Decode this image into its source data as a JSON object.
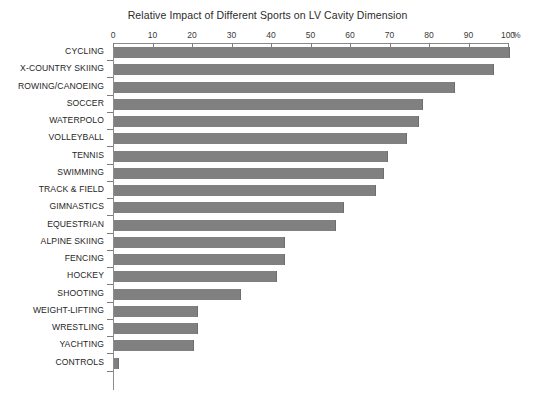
{
  "chart_data": {
    "type": "bar",
    "orientation": "horizontal",
    "title": "Relative Impact of Different Sports on LV Cavity Dimension",
    "xlabel": "%",
    "ylabel": "",
    "xlim": [
      0,
      100
    ],
    "xticks": [
      0,
      10,
      20,
      30,
      40,
      50,
      60,
      70,
      80,
      90,
      100
    ],
    "xtick_labels": [
      "0",
      "10",
      "20",
      "30",
      "40",
      "50",
      "60",
      "70",
      "80",
      "90",
      "100"
    ],
    "unit_suffix": "%",
    "grid": false,
    "legend": null,
    "bar_color": "#808080",
    "categories": [
      "CYCLING",
      "X-COUNTRY SKIING",
      "ROWING/CANOEING",
      "SOCCER",
      "WATERPOLO",
      "VOLLEYBALL",
      "TENNIS",
      "SWIMMING",
      "TRACK & FIELD",
      "GIMNASTICS",
      "EQUESTRIAN",
      "ALPINE SKIING",
      "FENCING",
      "HOCKEY",
      "SHOOTING",
      "WEIGHT-LIFTING",
      "WRESTLING",
      "YACHTING",
      "CONTROLS"
    ],
    "values": [
      100,
      96,
      86,
      78,
      77,
      74,
      69,
      68,
      66,
      58,
      56,
      43,
      43,
      41,
      32,
      21,
      21,
      20,
      1
    ]
  },
  "caption": {
    "text": ""
  }
}
